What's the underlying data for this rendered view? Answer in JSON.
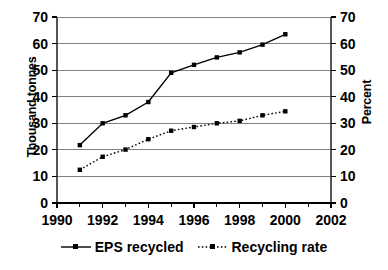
{
  "chart_data": {
    "type": "line",
    "title": "",
    "subtitle": "",
    "xlabel": "",
    "ylabel": "Thousand tonnes",
    "ylabel_secondary": "Percent",
    "xlim": [
      1990,
      2002
    ],
    "xticks": [
      1990,
      1992,
      1994,
      1996,
      1998,
      2000,
      2002
    ],
    "xtick_labels": [
      "1990",
      "1992",
      "1994",
      "1996",
      "1998",
      "2000",
      "2002"
    ],
    "x_minor_ticks": [
      1991,
      1993,
      1995,
      1997,
      1999,
      2001
    ],
    "ylim": [
      0,
      70
    ],
    "yticks": [
      0,
      10,
      20,
      30,
      40,
      50,
      60,
      70
    ],
    "ytick_labels": [
      "0",
      "10",
      "20",
      "30",
      "40",
      "50",
      "60",
      "70"
    ],
    "ylim_secondary": [
      0,
      70
    ],
    "yticks_secondary": [
      0,
      10,
      20,
      30,
      40,
      50,
      60,
      70
    ],
    "ytick_labels_secondary": [
      "0",
      "10",
      "20",
      "30",
      "40",
      "50",
      "60",
      "70"
    ],
    "grid": "horizontal",
    "legend_position": "bottom",
    "x": [
      1991,
      1992,
      1993,
      1994,
      1995,
      1996,
      1997,
      1998,
      1999,
      2000
    ],
    "series": [
      {
        "name": "EPS recycled",
        "axis": "left",
        "units": "thousand tonnes",
        "line_style": "solid",
        "marker": "square",
        "color": "#000000",
        "values": [
          21.8,
          30.0,
          33.0,
          38.0,
          49.0,
          52.0,
          54.8,
          56.7,
          59.6,
          63.5
        ]
      },
      {
        "name": "Recycling rate",
        "axis": "right",
        "units": "percent",
        "line_style": "dotted",
        "marker": "square",
        "color": "#000000",
        "values": [
          12.5,
          17.4,
          20.1,
          24.0,
          27.2,
          28.6,
          30.0,
          30.9,
          33.0,
          34.5
        ]
      }
    ]
  },
  "legend": {
    "items": [
      {
        "label": "EPS recycled",
        "style": "solid"
      },
      {
        "label": "Recycling rate",
        "style": "dotted"
      }
    ]
  },
  "colors": {
    "axis": "#000000",
    "grid": "#808080",
    "series": "#000000",
    "background": "#ffffff"
  }
}
